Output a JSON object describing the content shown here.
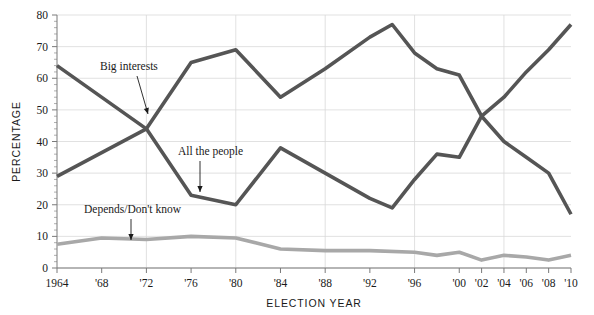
{
  "chart_data": {
    "type": "line",
    "title": "",
    "xlabel": "ELECTION YEAR",
    "ylabel": "PERCENTAGE",
    "xlim": [
      1964,
      2010
    ],
    "ylim": [
      0,
      80
    ],
    "ytick_step": 10,
    "grid": true,
    "legend": "inline-annotations",
    "x": [
      1964,
      1968,
      1972,
      1976,
      1980,
      1984,
      1988,
      1992,
      1994,
      1996,
      1998,
      2000,
      2002,
      2004,
      2006,
      2008,
      2010
    ],
    "xtick_labels": [
      "1964",
      "'68",
      "'72",
      "'76",
      "'80",
      "'84",
      "'88",
      "'92",
      "'96",
      "'00",
      "'02",
      "'04",
      "'06",
      "'08",
      "'10"
    ],
    "xtick_values": [
      1964,
      1968,
      1972,
      1976,
      1980,
      1984,
      1988,
      1992,
      1996,
      2000,
      2002,
      2004,
      2006,
      2008,
      2010
    ],
    "ytick_labels": [
      "0",
      "10",
      "20",
      "30",
      "40",
      "50",
      "60",
      "70",
      "80"
    ],
    "ytick_values": [
      0,
      10,
      20,
      30,
      40,
      50,
      60,
      70,
      80
    ],
    "series": [
      {
        "name": "Big interests",
        "color": "#555555",
        "width": 3.6,
        "x": [
          1964,
          1972,
          1976,
          1980,
          1984,
          1988,
          1992,
          1994,
          1996,
          1998,
          2000,
          2002,
          2004,
          2006,
          2008,
          2010
        ],
        "values": [
          29,
          44,
          65,
          69,
          54,
          63,
          73,
          77,
          68,
          63,
          61,
          48,
          40,
          35,
          30,
          17
        ]
      },
      {
        "name": "All the people",
        "color": "#555555",
        "width": 3.6,
        "x": [
          1964,
          1972,
          1976,
          1980,
          1984,
          1988,
          1992,
          1994,
          1996,
          1998,
          2000,
          2002,
          2004,
          2006,
          2008,
          2010
        ],
        "values": [
          64,
          44,
          23,
          20,
          38,
          30,
          22,
          19,
          28,
          36,
          35,
          48,
          54,
          62,
          69,
          77
        ]
      },
      {
        "name": "Depends/Don't know",
        "color": "#a8a8a8",
        "width": 3.6,
        "x": [
          1964,
          1968,
          1972,
          1976,
          1980,
          1984,
          1988,
          1992,
          1996,
          1998,
          2000,
          2002,
          2004,
          2006,
          2008,
          2010
        ],
        "values": [
          7.5,
          9.5,
          9,
          10,
          9.5,
          6,
          5.5,
          5.5,
          5,
          4,
          5,
          2.5,
          4,
          3.5,
          2.5,
          4
        ]
      }
    ],
    "annotations": [
      {
        "label": "Big interests",
        "label_x": 100,
        "label_y": 70,
        "tip_x": 148,
        "tip_y": 114,
        "from_x": 137,
        "from_y": 76
      },
      {
        "label": "All the people",
        "label_x": 178,
        "label_y": 155,
        "tip_x": 200,
        "tip_y": 192,
        "from_x": 200,
        "from_y": 161
      },
      {
        "label": "Depends/Don't know",
        "label_x": 84,
        "label_y": 213,
        "tip_x": 131,
        "tip_y": 240,
        "from_x": 131,
        "from_y": 219
      }
    ]
  }
}
